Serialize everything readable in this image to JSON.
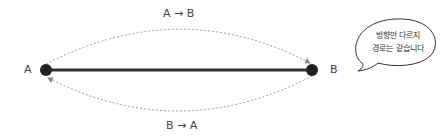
{
  "diagram": {
    "nodes": [
      {
        "id": "A",
        "label": "A"
      },
      {
        "id": "B",
        "label": "B"
      }
    ],
    "edges": [
      {
        "from": "A",
        "to": "B",
        "label": "A → B",
        "style": "dashed-curve-top"
      },
      {
        "from": "B",
        "to": "A",
        "label": "B → A",
        "style": "dashed-curve-bottom"
      },
      {
        "from": "A",
        "to": "B",
        "label": "",
        "style": "solid-line"
      }
    ],
    "callout": {
      "line1": "방향만 다르지",
      "line2": "경로는 같습니다"
    },
    "colors": {
      "node": "#222222",
      "solid_line": "#333333",
      "dashed": "#999999"
    }
  }
}
